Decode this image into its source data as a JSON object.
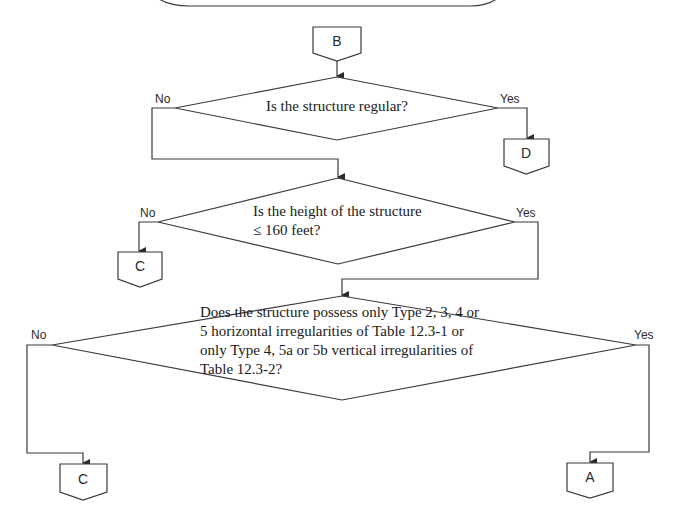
{
  "flowchart": {
    "entry_connector": {
      "label": "B"
    },
    "decisions": [
      {
        "id": "d1",
        "lines": [
          "Is the structure regular?"
        ],
        "no_label": "No",
        "yes_label": "Yes"
      },
      {
        "id": "d2",
        "lines": [
          "Is the height of the structure",
          "≤ 160 feet?"
        ],
        "no_label": "No",
        "yes_label": "Yes"
      },
      {
        "id": "d3",
        "lines": [
          "Does the structure possess only Type 2, 3, 4 or",
          "5 horizontal irregularities of Table 12.3-1 or",
          "only Type 4, 5a or 5b vertical irregularities of",
          "Table 12.3-2?"
        ],
        "no_label": "No",
        "yes_label": "Yes"
      }
    ],
    "connectors": {
      "d1_yes": "D",
      "d2_no": "C",
      "d3_no": "C",
      "d3_yes": "A"
    }
  }
}
